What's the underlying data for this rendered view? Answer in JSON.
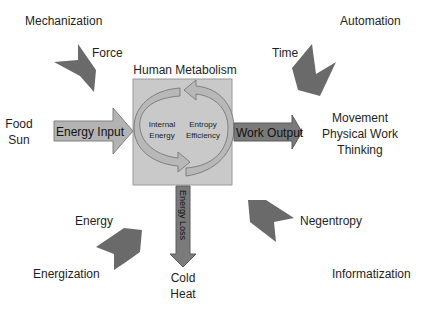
{
  "diagram": {
    "title": "Human Metabolism",
    "center": {
      "left_label_line1": "Internal",
      "left_label_line2": "Energy",
      "right_label_line1": "Entropy",
      "right_label_line2": "Efficiency"
    },
    "arrows": {
      "input": "Energy Input",
      "output": "Work Output",
      "loss": "Energy Loss"
    },
    "inputs_left": [
      "Food",
      "Sun"
    ],
    "outputs_right": [
      "Movement",
      "Physical Work",
      "Thinking"
    ],
    "outputs_bottom": [
      "Cold",
      "Heat"
    ],
    "corners": {
      "top_left": {
        "region": "Mechanization",
        "arrow_label": "Force"
      },
      "top_right": {
        "region": "Automation",
        "arrow_label": "Time"
      },
      "bottom_left": {
        "region": "Energization",
        "arrow_label": "Energy"
      },
      "bottom_right": {
        "region": "Informatization",
        "arrow_label": "Negentropy"
      }
    },
    "colors": {
      "box_fill": "#c9c9c9",
      "box_border": "#9a9a9a",
      "input_arrow": "#b3b3b3",
      "output_arrow": "#7a7a7a",
      "corner_arrow": "#6a6a6a",
      "cycle_light": "#b8b8b8",
      "cycle_dark": "#8a8a8a"
    }
  }
}
